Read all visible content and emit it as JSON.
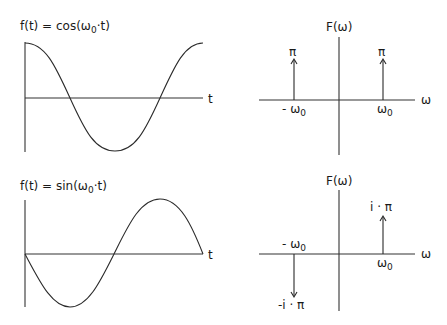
{
  "panels": {
    "cos_time": {
      "title_prefix": "f(t) = cos(ω",
      "title_sub": "0",
      "title_suffix": "·t)",
      "x_axis_label": "t"
    },
    "cos_freq": {
      "title": "F(ω)",
      "x_axis_label": "ω",
      "neg_label_prefix": "- ω",
      "neg_label_sub": "0",
      "pos_label_prefix": "ω",
      "pos_label_sub": "0",
      "neg_impulse_label": "π",
      "pos_impulse_label": "π"
    },
    "sin_time": {
      "title_prefix": "f(t) = sin(ω",
      "title_sub": "0",
      "title_suffix": "·t)",
      "x_axis_label": "t"
    },
    "sin_freq": {
      "title": "F(ω)",
      "x_axis_label": "ω",
      "neg_label_prefix": "- ω",
      "neg_label_sub": "0",
      "pos_label_prefix": "ω",
      "pos_label_sub": "0",
      "neg_impulse_label": "-i · π",
      "pos_impulse_label": "i · π"
    }
  },
  "colors": {
    "background": "#ffffff",
    "ink": "#2a2a2a"
  }
}
